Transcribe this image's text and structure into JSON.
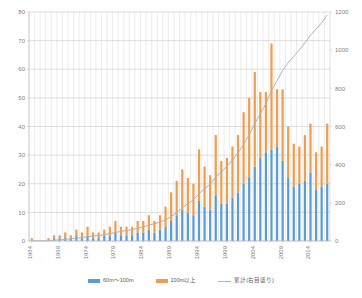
{
  "chart": {
    "title": "",
    "legend_position": "bottom",
    "grid": true
  },
  "legend": {
    "items": [
      {
        "label": "60m〜100m",
        "color": "#5b9bd5",
        "marker": "swatch",
        "name": "legend-series-60-100m"
      },
      {
        "label": "100m以上",
        "color": "#ed9e4f",
        "marker": "swatch",
        "name": "legend-series-over-100m"
      },
      {
        "label": "累計(右目盛り)",
        "color": "#b3b3b3",
        "marker": "line",
        "name": "legend-series-cumulative"
      }
    ]
  },
  "axes": {
    "left": {
      "min": 0,
      "max": 80,
      "step": 10,
      "ticks": [
        "0",
        "10",
        "20",
        "30",
        "40",
        "50",
        "60",
        "70",
        "80"
      ]
    },
    "right": {
      "min": 0,
      "max": 1200,
      "step": 200,
      "ticks": [
        "0",
        "200",
        "400",
        "600",
        "800",
        "1000",
        "1200"
      ]
    },
    "bottom": {
      "labels": [
        "1964",
        "1969",
        "1974",
        "1979",
        "1984",
        "1989",
        "1994",
        "1999",
        "2004",
        "2009",
        "2014"
      ]
    }
  },
  "chart_data": {
    "type": "bar",
    "title": "",
    "xlabel": "",
    "ylabel": "",
    "ylim": [
      0,
      80
    ],
    "y2lim": [
      0,
      1200
    ],
    "grid": true,
    "legend_position": "bottom",
    "categories": [
      "1964",
      "1965",
      "1966",
      "1967",
      "1968",
      "1969",
      "1970",
      "1971",
      "1972",
      "1973",
      "1974",
      "1975",
      "1976",
      "1977",
      "1978",
      "1979",
      "1980",
      "1981",
      "1982",
      "1983",
      "1984",
      "1985",
      "1986",
      "1987",
      "1988",
      "1989",
      "1990",
      "1991",
      "1992",
      "1993",
      "1994",
      "1995",
      "1996",
      "1997",
      "1998",
      "1999",
      "2000",
      "2001",
      "2002",
      "2003",
      "2004",
      "2005",
      "2006",
      "2007",
      "2008",
      "2009",
      "2010",
      "2011",
      "2012",
      "2013",
      "2014",
      "2015",
      "2016",
      "2017"
    ],
    "series": [
      {
        "name": "60m〜100m",
        "color": "#5b9bd5",
        "stack": "completions",
        "values": [
          0,
          0,
          0,
          0,
          1,
          1,
          1,
          1,
          2,
          1,
          2,
          1,
          1,
          2,
          2,
          3,
          2,
          2,
          2,
          3,
          3,
          4,
          3,
          4,
          5,
          7,
          9,
          11,
          10,
          9,
          14,
          12,
          11,
          16,
          13,
          13,
          15,
          17,
          20,
          22,
          26,
          29,
          31,
          32,
          33,
          28,
          22,
          19,
          20,
          21,
          24,
          18,
          19,
          20
        ]
      },
      {
        "name": "100m以上",
        "color": "#ed9e4f",
        "stack": "completions",
        "values": [
          1,
          0,
          0,
          1,
          1,
          1,
          2,
          1,
          2,
          2,
          3,
          2,
          2,
          2,
          3,
          4,
          3,
          3,
          3,
          4,
          4,
          5,
          4,
          5,
          7,
          10,
          12,
          14,
          12,
          11,
          18,
          14,
          12,
          21,
          15,
          16,
          18,
          20,
          25,
          28,
          33,
          23,
          21,
          37,
          20,
          25,
          18,
          15,
          13,
          16,
          17,
          13,
          14,
          21
        ]
      }
    ],
    "line_series": {
      "name": "累計(右目盛り)",
      "color": "#b3b3b3",
      "axis": "right",
      "values": [
        1,
        1,
        1,
        2,
        4,
        6,
        9,
        11,
        15,
        18,
        23,
        26,
        29,
        33,
        38,
        45,
        50,
        55,
        60,
        67,
        74,
        83,
        90,
        99,
        111,
        128,
        149,
        174,
        196,
        216,
        248,
        274,
        297,
        334,
        362,
        391,
        424,
        461,
        506,
        556,
        615,
        667,
        719,
        788,
        841,
        894,
        934,
        968,
        1001,
        1038,
        1079,
        1110,
        1143,
        1184
      ]
    }
  }
}
